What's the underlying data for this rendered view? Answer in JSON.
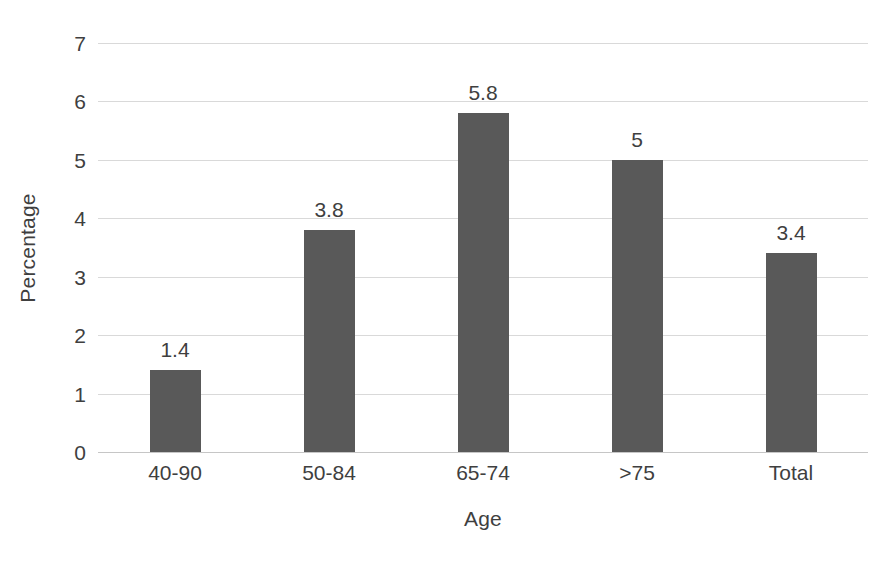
{
  "chart_data": {
    "type": "bar",
    "title": "",
    "subtitle": "",
    "xlabel": "Age",
    "ylabel": "Percentage",
    "categories": [
      "40-90",
      "50-84",
      "65-74",
      ">75",
      "Total"
    ],
    "values": [
      1.4,
      3.8,
      5.8,
      5,
      3.4
    ],
    "value_labels": [
      "1.4",
      "3.8",
      "5.8",
      "5",
      "3.4"
    ],
    "ylim": [
      0,
      7
    ],
    "ytick_labels": [
      "0",
      "1",
      "2",
      "3",
      "4",
      "5",
      "6",
      "7"
    ],
    "ytick_values": [
      0,
      1,
      2,
      3,
      4,
      5,
      6,
      7
    ],
    "grid": "horizontal",
    "legend": "none",
    "series": [
      {
        "name": "Percentage",
        "values": [
          1.4,
          3.8,
          5.8,
          5,
          3.4
        ]
      }
    ],
    "colors": {
      "bar": "#595959",
      "gridline": "#d9d9d9",
      "baseline": "#c6c6c6",
      "text": "#3f3f3f",
      "background": "#ffffff"
    }
  }
}
